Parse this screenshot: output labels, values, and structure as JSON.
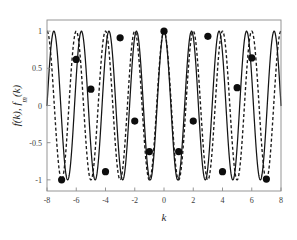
{
  "chart_data": {
    "type": "line",
    "title": "",
    "subtitle": "",
    "xlabel": "k",
    "ylabel": "f(k), f_m(k)",
    "ylabel_parts": {
      "f_main": "f",
      "arg": "(k)",
      "separator": ", ",
      "f_approx": "f",
      "f_approx_sub": "m",
      "arg2": "(k)"
    },
    "xlim": [
      -8,
      8
    ],
    "ylim": [
      -1.15,
      1.15
    ],
    "xticks": [
      -8,
      -6,
      -4,
      -2,
      0,
      2,
      4,
      6,
      8
    ],
    "xticklabels": [
      "-8",
      "-6",
      "-4",
      "-2",
      "0",
      "2",
      "4",
      "6",
      "8"
    ],
    "yticks": [
      -1,
      -0.5,
      0,
      0.5,
      1
    ],
    "yticklabels": [
      "-1",
      "-0.5",
      "0",
      "0.5",
      "1"
    ],
    "grid": false,
    "legend": "none",
    "axis_color": "#8a8a8a",
    "series": [
      {
        "name": "f(k)",
        "style": "solid",
        "color": "#141414",
        "linewidth": 1.25,
        "description": "Solid high-frequency oscillation, amplitude 1, about 8.5 cycles across k in [-8, 8]",
        "frequency_cycles_per_unit": 0.53125,
        "phase_deg": 0,
        "amplitude": 1
      },
      {
        "name": "f_m(k)",
        "style": "dashed",
        "color": "#1a1a1a",
        "linewidth": 1.35,
        "dash": "3.1 2.3",
        "description": "Dashed oscillation of slightly lower frequency, drifting in phase relative to the solid curve, amplitude 1",
        "frequency_cycles_per_unit": 0.5,
        "phase_deg": 0,
        "amplitude": 1
      }
    ],
    "markers": {
      "name": "integer samples",
      "shape": "filled-circle",
      "color": "#0d0d0d",
      "radius_px": 3.6,
      "x": [
        -7,
        -6,
        -5,
        -4,
        -3,
        -2,
        -1,
        0,
        1,
        2,
        3,
        4,
        5,
        6,
        7
      ],
      "y": [
        -1.0,
        0.62,
        0.22,
        -0.89,
        0.91,
        -0.21,
        -0.62,
        1.0,
        -0.62,
        -0.21,
        0.93,
        -0.89,
        0.24,
        0.64,
        -0.99
      ]
    }
  },
  "figure": {
    "background": "#ffffff",
    "plot_background": "#ffffff",
    "width_px": 297,
    "height_px": 240
  }
}
